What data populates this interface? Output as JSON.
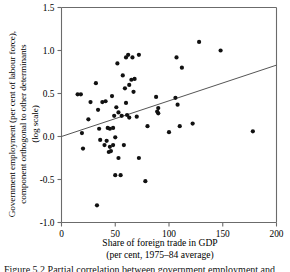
{
  "figure": {
    "ylabel_line1": "Government employment (per cent of labour force),",
    "ylabel_line2": "component orthogonal to other determinants",
    "ylabel_line3": "(log scale)",
    "xlabel_line1": "Share of foreign trade in GDP",
    "xlabel_line2": "(per cent, 1975–84 average)",
    "caption": "Figure 5.2  Partial correlation between government employment and"
  },
  "axes": {
    "x_ticks": [
      "0",
      "50",
      "100",
      "150",
      "200"
    ],
    "y_ticks": [
      "1.5",
      "1.0",
      "0.5",
      "0.0",
      "-0.5",
      "-1.0"
    ]
  },
  "colors": {
    "axis": "#6b6b6b",
    "point": "#111111",
    "line": "#555555",
    "background": "#ffffff"
  },
  "chart_data": {
    "type": "scatter",
    "title": "",
    "xlabel": "Share of foreign trade in GDP (per cent, 1975–84 average)",
    "ylabel": "Government employment (per cent of labour force), component orthogonal to other determinants (log scale)",
    "xlim": [
      0,
      200
    ],
    "ylim": [
      -1.0,
      1.5
    ],
    "x_tick_values": [
      0,
      50,
      100,
      150,
      200
    ],
    "y_tick_values": [
      1.5,
      1.0,
      0.5,
      0.0,
      -0.5,
      -1.0
    ],
    "grid": false,
    "legend": null,
    "trendline": {
      "type": "linear-fit",
      "x_start": 0,
      "y_start": 0.0,
      "x_end": 200,
      "y_end": 0.83
    },
    "points": [
      [
        15,
        0.49
      ],
      [
        18,
        0.49
      ],
      [
        19,
        0.04
      ],
      [
        20,
        -0.14
      ],
      [
        25,
        0.2
      ],
      [
        27,
        0.4
      ],
      [
        32,
        0.62
      ],
      [
        33,
        -0.8
      ],
      [
        34,
        0.31
      ],
      [
        35,
        0.09
      ],
      [
        36,
        -0.04
      ],
      [
        38,
        0.4
      ],
      [
        40,
        -0.1
      ],
      [
        41,
        0.41
      ],
      [
        42,
        -0.05
      ],
      [
        43,
        0.1
      ],
      [
        44,
        -0.18
      ],
      [
        45,
        0.09
      ],
      [
        45,
        -0.12
      ],
      [
        46,
        -0.17
      ],
      [
        47,
        0.47
      ],
      [
        48,
        -0.1
      ],
      [
        48,
        0.1
      ],
      [
        49,
        0.24
      ],
      [
        50,
        -0.01
      ],
      [
        50,
        -0.45
      ],
      [
        51,
        0.34
      ],
      [
        52,
        0.85
      ],
      [
        53,
        0.28
      ],
      [
        53,
        -0.25
      ],
      [
        55,
        -0.45
      ],
      [
        56,
        0.24
      ],
      [
        57,
        0.71
      ],
      [
        58,
        -0.1
      ],
      [
        59,
        0.56
      ],
      [
        60,
        0.92
      ],
      [
        60,
        0.39
      ],
      [
        61,
        0.25
      ],
      [
        62,
        0.95
      ],
      [
        63,
        0.6
      ],
      [
        63,
        0.22
      ],
      [
        65,
        0.66
      ],
      [
        66,
        0.92
      ],
      [
        67,
        0.52
      ],
      [
        68,
        0.67
      ],
      [
        70,
        0.23
      ],
      [
        72,
        -0.25
      ],
      [
        72,
        0.95
      ],
      [
        78,
        -0.52
      ],
      [
        80,
        0.12
      ],
      [
        88,
        0.46
      ],
      [
        89,
        0.29
      ],
      [
        90,
        0.33
      ],
      [
        90,
        0.27
      ],
      [
        100,
        0.05
      ],
      [
        106,
        0.45
      ],
      [
        107,
        0.92
      ],
      [
        108,
        0.37
      ],
      [
        110,
        0.12
      ],
      [
        112,
        0.8
      ],
      [
        122,
        0.15
      ],
      [
        128,
        1.1
      ],
      [
        148,
        1.0
      ],
      [
        178,
        0.06
      ]
    ]
  }
}
